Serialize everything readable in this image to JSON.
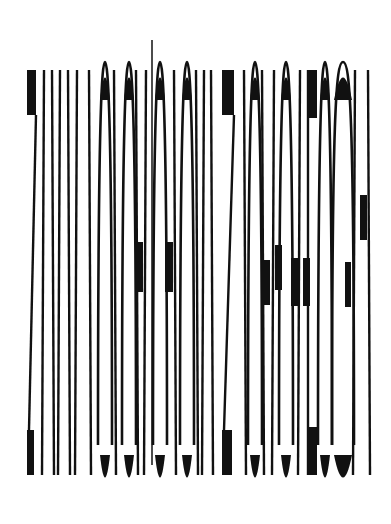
{
  "artwork": {
    "description": "Abstract condensed-lettering text art of vertical black strokes on white",
    "background": "#ffffff",
    "ink": "#111111",
    "top": 70,
    "bottom": 475,
    "strokes": [
      {
        "x1": 27,
        "x2": 36,
        "type": "z"
      },
      {
        "x": 44,
        "type": "line"
      },
      {
        "x": 52,
        "type": "line"
      },
      {
        "x": 60,
        "type": "line"
      },
      {
        "x": 68,
        "type": "line"
      },
      {
        "x": 77,
        "type": "line"
      },
      {
        "x": 89,
        "type": "line"
      },
      {
        "x": 102,
        "type": "o"
      },
      {
        "x": 114,
        "type": "line"
      },
      {
        "x": 126,
        "type": "o"
      },
      {
        "x": 136,
        "type": "line"
      },
      {
        "x": 146,
        "type": "line"
      },
      {
        "x": 152,
        "type": "spike"
      },
      {
        "x": 157,
        "type": "o"
      },
      {
        "x": 174,
        "type": "line"
      },
      {
        "x": 184,
        "type": "o"
      },
      {
        "x": 196,
        "type": "line"
      },
      {
        "x": 204,
        "type": "line"
      },
      {
        "x": 211,
        "type": "line"
      },
      {
        "x1": 222,
        "x2": 234,
        "type": "z"
      },
      {
        "x": 244,
        "type": "line"
      },
      {
        "x": 252,
        "type": "o"
      },
      {
        "x": 262,
        "type": "line"
      },
      {
        "x": 274,
        "type": "line"
      },
      {
        "x": 283,
        "type": "o"
      },
      {
        "x": 300,
        "type": "line"
      },
      {
        "x1": 307,
        "x2": 317,
        "type": "block"
      },
      {
        "x": 322,
        "type": "o"
      },
      {
        "x1": 336,
        "x2": 344,
        "type": "o"
      },
      {
        "x": 355,
        "type": "line"
      },
      {
        "x": 368,
        "type": "line"
      }
    ],
    "mid_blocks": [
      {
        "x": 136,
        "y": 242,
        "w": 7,
        "h": 50
      },
      {
        "x": 165,
        "y": 242,
        "w": 8,
        "h": 50
      },
      {
        "x": 262,
        "y": 260,
        "w": 8,
        "h": 45
      },
      {
        "x": 275,
        "y": 245,
        "w": 7,
        "h": 45
      },
      {
        "x": 291,
        "y": 258,
        "w": 8,
        "h": 48
      },
      {
        "x": 303,
        "y": 258,
        "w": 7,
        "h": 48
      },
      {
        "x": 345,
        "y": 262,
        "w": 6,
        "h": 45
      },
      {
        "x": 360,
        "y": 195,
        "w": 7,
        "h": 45
      }
    ]
  }
}
